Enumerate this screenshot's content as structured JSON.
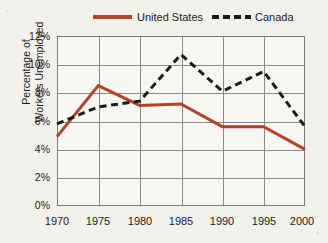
{
  "legend": {
    "position": "top",
    "entries": [
      {
        "label": "United States",
        "style": "solid",
        "color": "#b0442a",
        "icon": "solid-line-swatch-icon"
      },
      {
        "label": "Canada",
        "style": "dashed",
        "color": "#1a1a1a",
        "icon": "dashed-line-swatch-icon"
      }
    ]
  },
  "axes": {
    "ylabel_line1": "Percentage of",
    "ylabel_line2": "Workers Unemployed",
    "yticks": [
      "0%",
      "2%",
      "4%",
      "6%",
      "8%",
      "10%",
      "12%"
    ],
    "xticks": [
      "1970",
      "1975",
      "1980",
      "1985",
      "1990",
      "1995",
      "2000"
    ]
  },
  "chart_data": {
    "type": "line",
    "title": "",
    "xlabel": "",
    "ylabel": "Percentage of Workers Unemployed",
    "x": [
      1970,
      1975,
      1980,
      1985,
      1990,
      1995,
      2000
    ],
    "categories": [
      "1970",
      "1975",
      "1980",
      "1985",
      "1990",
      "1995",
      "2000"
    ],
    "series": [
      {
        "name": "United States",
        "color": "#b0442a",
        "style": "solid",
        "values": [
          4.9,
          8.5,
          7.1,
          7.2,
          5.6,
          5.6,
          4.0
        ]
      },
      {
        "name": "Canada",
        "color": "#1a1a1a",
        "style": "dashed",
        "values": [
          5.8,
          7.0,
          7.4,
          10.7,
          8.1,
          9.5,
          5.6
        ]
      }
    ],
    "xlim": [
      1970,
      2000
    ],
    "ylim": [
      0,
      12
    ],
    "ytick_values": [
      0,
      2,
      4,
      6,
      8,
      10,
      12
    ],
    "ytick_suffix": "%",
    "grid": true,
    "legend_position": "top"
  }
}
